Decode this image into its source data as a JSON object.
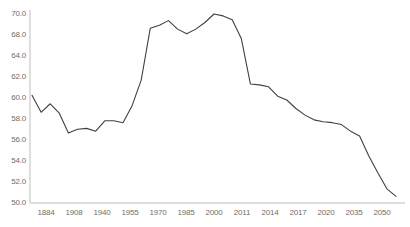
{
  "chart_data": {
    "type": "line",
    "title": "",
    "subtitle": "",
    "xlabel": "",
    "ylabel": "",
    "grid": false,
    "legend": "none",
    "line_color": "#404040",
    "axis_color": "#bfbfbf",
    "label_color": "#6e6e6e",
    "ylim": [
      50.0,
      70.0
    ],
    "y_tick_labels": [
      "70.0",
      "68.0",
      "64.0",
      "62.0",
      "60.0",
      "58.0",
      "56.0",
      "54.0",
      "52.0",
      "50.0"
    ],
    "y_tick_values": [
      70.0,
      68.0,
      66.0,
      64.0,
      62.0,
      60.0,
      58.0,
      56.0,
      54.0,
      52.0,
      50.0
    ],
    "x_tick_labels": [
      "1884",
      "1908",
      "1940",
      "1955",
      "1970",
      "1985",
      "2000",
      "2011",
      "2014",
      "2017",
      "2020",
      "2035",
      "2050"
    ],
    "categories": [
      "1884",
      "1890",
      "1896",
      "1902",
      "1908",
      "1914",
      "1920",
      "1926",
      "1932",
      "1940",
      "1946",
      "1950",
      "1955",
      "1960",
      "1965",
      "1970",
      "1973",
      "1977",
      "1980",
      "1985",
      "1990",
      "1993",
      "1996",
      "2000",
      "2003",
      "2006",
      "2008",
      "2011",
      "2012",
      "2014",
      "2016",
      "2017",
      "2019",
      "2020",
      "2025",
      "2030",
      "2035",
      "2040",
      "2045",
      "2050",
      "2055"
    ],
    "values": [
      61.4,
      59.6,
      60.5,
      59.5,
      57.4,
      57.8,
      57.9,
      57.6,
      58.7,
      58.7,
      58.5,
      60.3,
      63.0,
      68.5,
      68.8,
      69.3,
      68.4,
      67.9,
      68.4,
      69.1,
      70.0,
      69.8,
      69.4,
      67.4,
      62.6,
      62.5,
      62.3,
      61.3,
      60.9,
      60.0,
      59.3,
      58.8,
      58.6,
      58.5,
      58.3,
      57.6,
      57.1,
      55.0,
      53.2,
      51.5,
      50.7
    ]
  }
}
